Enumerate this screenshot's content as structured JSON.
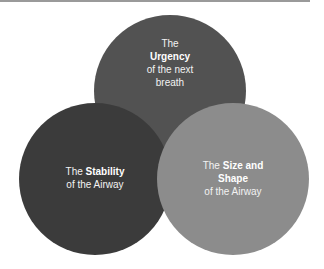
{
  "diagram": {
    "type": "venn",
    "circles": [
      {
        "id": "top",
        "color": "#525252",
        "lines": [
          {
            "pre": "The",
            "bold": "",
            "post": ""
          },
          {
            "pre": "",
            "bold": "Urgency",
            "post": ""
          },
          {
            "pre": "of the next",
            "bold": "",
            "post": ""
          },
          {
            "pre": "breath",
            "bold": "",
            "post": ""
          }
        ]
      },
      {
        "id": "left",
        "color": "#3b3b3b",
        "lines": [
          {
            "pre": "The ",
            "bold": "Stability",
            "post": ""
          },
          {
            "pre": "of the Airway",
            "bold": "",
            "post": ""
          }
        ]
      },
      {
        "id": "right",
        "color": "#8c8c8c",
        "lines": [
          {
            "pre": "The ",
            "bold": "Size and",
            "post": ""
          },
          {
            "pre": "",
            "bold": "Shape",
            "post": ""
          },
          {
            "pre": "of the Airway",
            "bold": "",
            "post": ""
          }
        ]
      }
    ]
  }
}
